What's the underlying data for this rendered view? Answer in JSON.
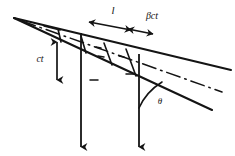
{
  "figure": {
    "background_color": "#ffffff",
    "ink_color": "#141414",
    "width": 235,
    "height": 156
  },
  "labels": {
    "path_length": "l",
    "beta_ct": "βct",
    "ct": "ct",
    "theta": "θ"
  },
  "annotations": {
    "measure_l_name": "horizontal double arrow spanning l",
    "measure_bct_name": "horizontal double arrow spanning beta c t",
    "measure_ct_name": "vertical double arrow spanning c t",
    "angle_theta_name": "angle arc theta between vertical ray and lower cone edge"
  },
  "geometry": {
    "apex": [
      14,
      18
    ],
    "upper_edge_end": [
      231,
      70
    ],
    "lower_edge_end": [
      212,
      110
    ],
    "axis_dashdot_end": [
      222,
      92
    ],
    "vertical_ray_1_x": 81,
    "vertical_ray_2_x": 139,
    "vertical_ray_bottom_y": 150
  },
  "elements": {
    "upper_cone_edge": "solid line",
    "lower_cone_edge": "solid line",
    "center_axis": "dash-dot line",
    "wedge_cross_ticks": "short transverse tick marks across cone wall",
    "ray_1": "downward arrow",
    "ray_2": "downward arrow"
  }
}
